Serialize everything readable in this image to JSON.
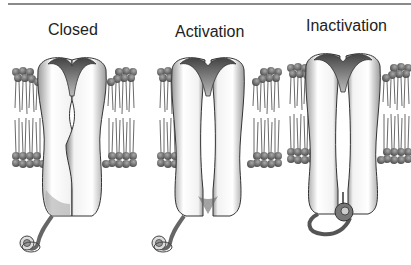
{
  "figure": {
    "panels": [
      {
        "label": "Closed",
        "state": "closed",
        "x": 48,
        "y": 21
      },
      {
        "label": "Activation",
        "state": "open",
        "x": 175,
        "y": 23
      },
      {
        "label": "Inactivation",
        "state": "inactivated",
        "x": 306,
        "y": 17
      }
    ],
    "colors": {
      "outline": "#333333",
      "lipid_head": "#7a7a7a",
      "shade_dark": "#555555",
      "rule": "#8a8a8a"
    }
  }
}
